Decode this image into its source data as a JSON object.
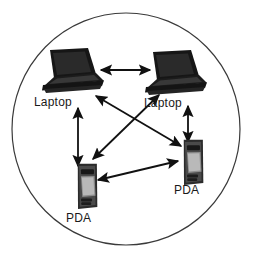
{
  "figure": {
    "type": "network-topology-diagram",
    "boundary": {
      "shape": "ellipse",
      "name": "ad-hoc-network-boundary",
      "stroke_color": "#3a3a3a",
      "fill_color": "#ffffff",
      "cx": 126,
      "cy": 129,
      "rx": 114,
      "ry": 116
    },
    "background_color": "#ffffff",
    "line_color": "#111111"
  },
  "nodes": [
    {
      "id": "laptop-top-left",
      "label": "Laptop",
      "icon": "laptop-icon",
      "x": 70,
      "y": 72,
      "label_x": 34,
      "label_y": 96
    },
    {
      "id": "laptop-top-right",
      "label": "Laptop",
      "icon": "laptop-icon",
      "x": 173,
      "y": 74,
      "label_x": 144,
      "label_y": 97
    },
    {
      "id": "pda-bottom-left",
      "label": "PDA",
      "icon": "pda-icon",
      "x": 86,
      "y": 185,
      "label_x": 66,
      "label_y": 212
    },
    {
      "id": "pda-bottom-right",
      "label": "PDA",
      "icon": "pda-icon",
      "x": 192,
      "y": 160,
      "label_x": 174,
      "label_y": 184
    }
  ],
  "links": [
    {
      "id": "link-laptop-laptop",
      "from": "laptop-top-left",
      "to": "laptop-top-right",
      "arrow": "bidirectional"
    },
    {
      "id": "link-laptopL-pdaL",
      "from": "laptop-top-left",
      "to": "pda-bottom-left",
      "arrow": "bidirectional"
    },
    {
      "id": "link-laptopR-pdaR",
      "from": "laptop-top-right",
      "to": "pda-bottom-right",
      "arrow": "bidirectional"
    },
    {
      "id": "link-laptopL-pdaR",
      "from": "laptop-top-left",
      "to": "pda-bottom-right",
      "arrow": "bidirectional"
    },
    {
      "id": "link-laptopR-pdaL",
      "from": "laptop-top-right",
      "to": "pda-bottom-left",
      "arrow": "bidirectional"
    },
    {
      "id": "link-pda-pda",
      "from": "pda-bottom-left",
      "to": "pda-bottom-right",
      "arrow": "bidirectional"
    }
  ]
}
